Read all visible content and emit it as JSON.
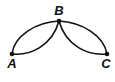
{
  "diagram": {
    "type": "graph",
    "colors": {
      "stroke": "#111111",
      "background": "#ffffff"
    },
    "nodes": [
      {
        "id": "A",
        "label": "A",
        "x": 12,
        "y": 54,
        "label_x": 12,
        "label_y": 68
      },
      {
        "id": "B",
        "label": "B",
        "x": 59,
        "y": 21,
        "label_x": 59,
        "label_y": 14
      },
      {
        "id": "C",
        "label": "C",
        "x": 107,
        "y": 54,
        "label_x": 106,
        "label_y": 68
      }
    ],
    "edges": [
      {
        "from": "A",
        "to": "B",
        "shape": "outer-arc"
      },
      {
        "from": "A",
        "to": "B",
        "shape": "inner-arc"
      },
      {
        "from": "B",
        "to": "C",
        "shape": "outer-arc"
      },
      {
        "from": "B",
        "to": "C",
        "shape": "inner-arc"
      }
    ]
  }
}
